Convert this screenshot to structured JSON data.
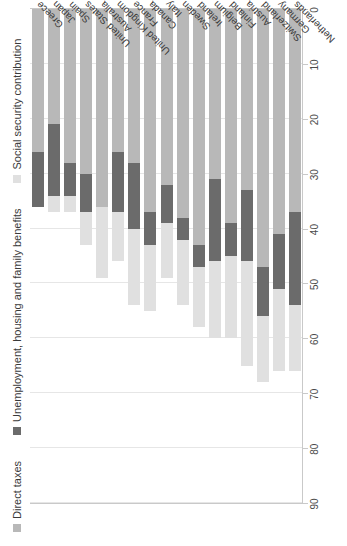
{
  "chart_data": {
    "type": "bar",
    "orientation": "horizontal-stacked-rotated",
    "title": "",
    "subtitle": "",
    "xlabel": "",
    "ylabel": "",
    "xlim": [
      0,
      90
    ],
    "xticks": [
      0,
      10,
      20,
      30,
      40,
      50,
      60,
      70,
      80,
      90
    ],
    "xtick_labels": [
      "0",
      "10",
      "20",
      "30",
      "40",
      "50",
      "60",
      "70",
      "80",
      "90"
    ],
    "grid": true,
    "legend_position": "top-left",
    "axis_direction": "reversed",
    "categories": [
      "Greece",
      "Japan",
      "Spain",
      "United States",
      "Australia",
      "United Kingdom",
      "France",
      "Canada",
      "Italy",
      "Sweden",
      "Ireland",
      "Belgium",
      "Finland",
      "Austria",
      "Switzerland",
      "Germany",
      "Netherlands"
    ],
    "series": [
      {
        "name": "Direct taxes",
        "color": "#b8b8b8",
        "values": [
          26,
          21,
          28,
          30,
          36,
          26,
          28,
          37,
          32,
          38,
          43,
          31,
          39,
          33,
          47,
          41,
          37
        ]
      },
      {
        "name": "Unemployment, housing and family benefits",
        "color": "#6b6b6b",
        "values": [
          10,
          13,
          6,
          7,
          0,
          11,
          12,
          6,
          7,
          4,
          4,
          15,
          6,
          13,
          9,
          10,
          17
        ]
      },
      {
        "name": "Social security contribution",
        "color": "#e0e0e0",
        "values": [
          0,
          3,
          3,
          6,
          13,
          9,
          14,
          12,
          10,
          12,
          11,
          14,
          15,
          19,
          12,
          15,
          12
        ]
      }
    ],
    "legend": [
      {
        "label": "Direct taxes",
        "color": "#b8b8b8"
      },
      {
        "label": "Unemployment, housing and family benefits",
        "color": "#6b6b6b"
      },
      {
        "label": "Social security contribution",
        "color": "#e0e0e0"
      }
    ],
    "colors": {
      "direct_taxes": "#b8b8b8",
      "benefits": "#6b6b6b",
      "social_security": "#e0e0e0",
      "gridline": "#e6e6e6",
      "axis": "#c9c9c9",
      "text": "#3a3a3a",
      "background": "#ffffff"
    }
  }
}
